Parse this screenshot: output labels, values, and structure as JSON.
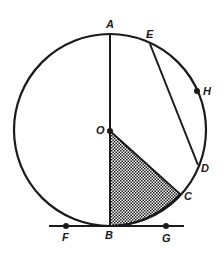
{
  "diagram": {
    "type": "geometry-circle",
    "labels": {
      "A": "A",
      "E": "E",
      "H": "H",
      "O": "O",
      "D": "D",
      "C": "C",
      "B": "B",
      "F": "F",
      "G": "G"
    },
    "colors": {
      "stroke": "#1a1a1a",
      "background": "#ffffff"
    }
  }
}
